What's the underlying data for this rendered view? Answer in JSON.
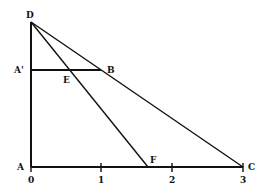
{
  "diagram": {
    "type": "geometry-similar-triangles",
    "points": {
      "D": {
        "label": "D",
        "x": 0,
        "y": 2
      },
      "A_prime": {
        "label": "A'",
        "x": 0,
        "y": 1.35
      },
      "E": {
        "label": "E",
        "x": 0.52,
        "y": 1.35
      },
      "B": {
        "label": "B",
        "x": 1.0,
        "y": 1.35
      },
      "A": {
        "label": "A",
        "x": 0,
        "y": 0
      },
      "F": {
        "label": "F",
        "x": 1.67,
        "y": 0
      },
      "C": {
        "label": "C",
        "x": 3,
        "y": 0
      }
    },
    "segments": [
      [
        "D",
        "A"
      ],
      [
        "A",
        "C"
      ],
      [
        "D",
        "C"
      ],
      [
        "D",
        "F"
      ],
      [
        "A_prime",
        "B"
      ]
    ],
    "axis": {
      "ticks": [
        "0",
        "1",
        "2",
        "3"
      ]
    },
    "colors": {
      "line": "#111111",
      "background": "#ffffff"
    }
  }
}
